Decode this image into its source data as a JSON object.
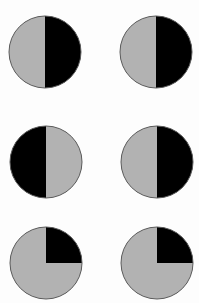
{
  "figure": {
    "width": 199,
    "height": 303,
    "background": "#fdfdfd",
    "colors": {
      "shaded": "#b2b2b2",
      "filled": "#000000",
      "outline": "#5a5a5a"
    },
    "circles": [
      {
        "id": "circle-1",
        "row": 1,
        "col": 1,
        "cx": 45,
        "cy": 52,
        "r": 36,
        "pattern": "left-gray-right-black",
        "black_fraction": 0.5
      },
      {
        "id": "circle-2",
        "row": 1,
        "col": 2,
        "cx": 156,
        "cy": 52,
        "r": 36,
        "pattern": "left-gray-right-black",
        "black_fraction": 0.5
      },
      {
        "id": "circle-3",
        "row": 2,
        "col": 1,
        "cx": 46,
        "cy": 162,
        "r": 36,
        "pattern": "left-black-right-gray",
        "black_fraction": 0.5
      },
      {
        "id": "circle-4",
        "row": 2,
        "col": 2,
        "cx": 157,
        "cy": 162,
        "r": 36,
        "pattern": "left-gray-right-black",
        "black_fraction": 0.5
      },
      {
        "id": "circle-5",
        "row": 3,
        "col": 1,
        "cx": 46,
        "cy": 263,
        "r": 36,
        "pattern": "top-right-quarter-black",
        "black_fraction": 0.25
      },
      {
        "id": "circle-6",
        "row": 3,
        "col": 2,
        "cx": 157,
        "cy": 263,
        "r": 36,
        "pattern": "top-right-quarter-black",
        "black_fraction": 0.25
      }
    ]
  }
}
